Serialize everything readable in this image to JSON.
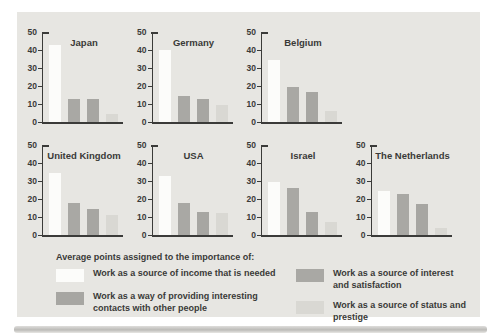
{
  "colors": {
    "page_bg": "#ffffff",
    "panel_bg": "#e7e6e2",
    "axis": "#3b3b39",
    "text": "#3a3a38",
    "income": "#fcfcfa",
    "interest": "#a9a8a4",
    "contacts": "#a7a6a2",
    "status": "#d9d8d3"
  },
  "chart_data": {
    "type": "bar",
    "xlabel": "",
    "ylabel": "",
    "ylim": [
      0,
      50
    ],
    "yticks": [
      0,
      10,
      20,
      30,
      40,
      50
    ],
    "grid": false,
    "series_keys": [
      "income",
      "interest",
      "contacts",
      "status"
    ],
    "series_names": [
      "Work as a source of income that is needed",
      "Work as a source of interest and satisfaction",
      "Work as a way of providing interesting contacts with other people",
      "Work as a source of status and prestige"
    ],
    "charts": [
      {
        "title": "Japan",
        "row": 0,
        "values": [
          43,
          13,
          13,
          4.5
        ]
      },
      {
        "title": "Germany",
        "row": 0,
        "values": [
          40,
          14.5,
          13,
          9.5
        ]
      },
      {
        "title": "Belgium",
        "row": 0,
        "values": [
          34.5,
          19.5,
          16.5,
          6
        ]
      },
      {
        "title": "United Kingdom",
        "row": 1,
        "values": [
          34.5,
          18,
          14.5,
          11
        ]
      },
      {
        "title": "USA",
        "row": 1,
        "values": [
          33,
          18,
          13,
          12.5
        ]
      },
      {
        "title": "Israel",
        "row": 1,
        "values": [
          29.5,
          26,
          13,
          7.5
        ]
      },
      {
        "title": "The Netherlands",
        "row": 1,
        "values": [
          24.5,
          23,
          17.5,
          4
        ]
      }
    ],
    "legend": {
      "header": "Average points assigned to the importance of:",
      "position": "bottom",
      "columns": [
        [
          {
            "key": "income",
            "label": "Work as a source of income that is needed"
          },
          {
            "key": "contacts",
            "label": "Work as a way of providing interesting contacts with other people"
          }
        ],
        [
          {
            "key": "interest",
            "label": "Work as a source of interest and satisfaction"
          },
          {
            "key": "status",
            "label": "Work as a source of status and prestige"
          }
        ]
      ]
    }
  }
}
